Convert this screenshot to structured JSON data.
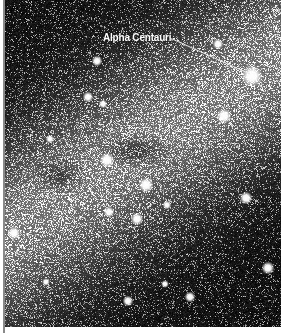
{
  "image": {
    "subject": "Milky Way star field in Centaurus",
    "background": "#0d0d0d"
  },
  "annotation": {
    "label": "Alpha Centauri",
    "label_pos": [
      98,
      32
    ],
    "line_from": [
      165,
      38
    ],
    "line_to": [
      245,
      74
    ],
    "target_star": [
      247,
      76
    ]
  },
  "bright_stars": [
    {
      "x": 247,
      "y": 76,
      "r": 5
    },
    {
      "x": 219,
      "y": 116,
      "r": 3.5
    },
    {
      "x": 102,
      "y": 160,
      "r": 3.5
    },
    {
      "x": 141,
      "y": 185,
      "r": 3.5
    },
    {
      "x": 132,
      "y": 219,
      "r": 3
    },
    {
      "x": 241,
      "y": 198,
      "r": 3
    },
    {
      "x": 263,
      "y": 268,
      "r": 3
    },
    {
      "x": 123,
      "y": 301,
      "r": 2.5
    },
    {
      "x": 185,
      "y": 297,
      "r": 2.5
    },
    {
      "x": 92,
      "y": 61,
      "r": 2.5
    },
    {
      "x": 83,
      "y": 97,
      "r": 2.5
    },
    {
      "x": 98,
      "y": 104,
      "r": 2
    },
    {
      "x": 213,
      "y": 44,
      "r": 2.5
    },
    {
      "x": 45,
      "y": 139,
      "r": 2
    },
    {
      "x": 104,
      "y": 212,
      "r": 2.5
    },
    {
      "x": 162,
      "y": 205,
      "r": 2
    },
    {
      "x": 41,
      "y": 282,
      "r": 1.8
    },
    {
      "x": 160,
      "y": 284,
      "r": 1.8
    },
    {
      "x": 9,
      "y": 233,
      "r": 3
    }
  ]
}
